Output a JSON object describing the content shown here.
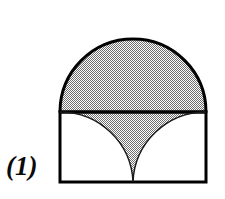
{
  "figure": {
    "label": "(1)",
    "caption_text": "(1)",
    "background_color": "#ffffff",
    "stroke_color": "#000000",
    "shade_color": "#a0a0a0",
    "shade_pattern": "50-percent-checkerboard-dither",
    "stroke_width_px": 3,
    "canvas": {
      "width": 225,
      "height": 199
    },
    "geometry": {
      "square": {
        "left": 60,
        "right": 206,
        "top": 112,
        "bottom": 182,
        "width": 146,
        "height": 70
      },
      "semicircle": {
        "center_x": 133,
        "center_y": 112,
        "radius": 73,
        "top_y": 39,
        "orientation": "upper-half",
        "shaded": true
      },
      "left_arc": {
        "center_x": 60,
        "center_y": 112,
        "radius": 73,
        "from": "top-left-corner",
        "to": "bottom-center-cusp"
      },
      "right_arc": {
        "center_x": 206,
        "center_y": 112,
        "radius": 73,
        "from": "top-right-corner",
        "to": "bottom-center-cusp"
      },
      "cusp": {
        "x": 133,
        "y": 182
      }
    },
    "parts": [
      {
        "name": "shaded-semicircle",
        "shaded": true
      },
      {
        "name": "shaded-cusp-region",
        "shaded": true
      },
      {
        "name": "left-white-region",
        "shaded": false
      },
      {
        "name": "right-white-region",
        "shaded": false
      }
    ]
  }
}
